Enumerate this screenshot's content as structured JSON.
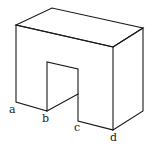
{
  "diagram": {
    "type": "isometric-block-with-notch",
    "stroke_color": "#1a1a1a",
    "labels": [
      {
        "id": "a",
        "text": "a",
        "x": 9,
        "y": 113
      },
      {
        "id": "b",
        "text": "b",
        "x": 42,
        "y": 122
      },
      {
        "id": "c",
        "text": "c",
        "x": 74,
        "y": 131
      },
      {
        "id": "d",
        "text": "d",
        "x": 110,
        "y": 141
      }
    ]
  }
}
